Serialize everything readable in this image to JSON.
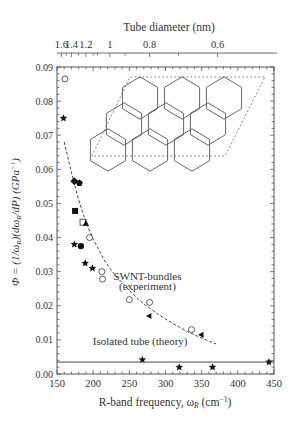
{
  "chart_data": {
    "type": "scatter",
    "title": "",
    "xlabel": "R-band frequency, ω_R (cm⁻¹)",
    "xlabel_parts": {
      "main": "R-band frequency, ω",
      "sub": "R",
      "unit": " (cm",
      "sup": "−1",
      "close": ")"
    },
    "ylabel": "Φ = (1/ω_R)(dω_R/dP) (GPa⁻¹)",
    "top_xlabel": "Tube diameter (nm)",
    "xlim": [
      150,
      450
    ],
    "ylim": [
      0.0,
      0.09
    ],
    "x_ticks": [
      "150",
      "200",
      "250",
      "300",
      "350",
      "400",
      "450"
    ],
    "y_ticks": [
      "0.00",
      "0.01",
      "0.02",
      "0.03",
      "0.04",
      "0.05",
      "0.06",
      "0.07",
      "0.08",
      "0.09"
    ],
    "top_ticks": [
      {
        "label": "1.6",
        "omega": 156
      },
      {
        "label": "1.4",
        "omega": 170
      },
      {
        "label": "1.2",
        "omega": 190
      },
      {
        "label": "1",
        "omega": 223
      },
      {
        "label": "0.8",
        "omega": 278
      },
      {
        "label": "0.6",
        "omega": 372
      }
    ],
    "grid": false,
    "annotations": [
      {
        "text": "SWNT-bundles",
        "x": 275,
        "y": 0.0275
      },
      {
        "text": "(experiment)",
        "x": 275,
        "y": 0.0245
      },
      {
        "text": "Isolated tube (theory)",
        "x": 265,
        "y": 0.0085
      }
    ],
    "series": [
      {
        "name": "open-circle",
        "marker": "circle-open",
        "points": [
          [
            161,
            0.0865
          ],
          [
            195,
            0.04
          ],
          [
            212,
            0.03
          ],
          [
            213,
            0.0278
          ],
          [
            250,
            0.0218
          ],
          [
            278,
            0.021
          ],
          [
            336,
            0.013
          ]
        ]
      },
      {
        "name": "star",
        "marker": "star",
        "points": [
          [
            159,
            0.075
          ],
          [
            174,
            0.038
          ],
          [
            189,
            0.0325
          ],
          [
            199,
            0.031
          ],
          [
            268,
            0.0042
          ],
          [
            319,
            0.002
          ],
          [
            365,
            0.002
          ],
          [
            443,
            0.0035
          ]
        ]
      },
      {
        "name": "diamond",
        "marker": "diamond-filled",
        "points": [
          [
            174,
            0.0565
          ]
        ]
      },
      {
        "name": "pentagon",
        "marker": "pentagon-filled",
        "points": [
          [
            181,
            0.056
          ]
        ]
      },
      {
        "name": "square-filled",
        "marker": "square-filled",
        "points": [
          [
            175,
            0.0478
          ]
        ]
      },
      {
        "name": "square-open",
        "marker": "square-open",
        "points": [
          [
            186,
            0.0445
          ]
        ]
      },
      {
        "name": "triangle",
        "marker": "triangle-filled",
        "points": [
          [
            190,
            0.044
          ]
        ]
      },
      {
        "name": "circle-filled",
        "marker": "circle-filled",
        "points": [
          [
            183,
            0.0375
          ]
        ]
      },
      {
        "name": "filled-left-triangle",
        "marker": "triangle-left",
        "points": [
          [
            278,
            0.017
          ],
          [
            350,
            0.0115
          ]
        ]
      },
      {
        "name": "SWNT-bundles fit",
        "type": "dashed-line",
        "x": [
          160,
          170,
          180,
          190,
          200,
          215,
          230,
          250,
          270,
          290,
          310,
          330,
          350,
          370
        ],
        "values": [
          0.068,
          0.059,
          0.051,
          0.0445,
          0.0395,
          0.0335,
          0.029,
          0.0245,
          0.0205,
          0.0175,
          0.0148,
          0.0125,
          0.0105,
          0.0088
        ]
      },
      {
        "name": "Isolated tube (theory)",
        "type": "line",
        "x": [
          150,
          450
        ],
        "values": [
          0.0035,
          0.0035
        ]
      }
    ]
  }
}
